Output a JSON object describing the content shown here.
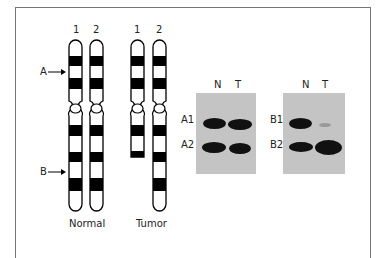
{
  "figure": {
    "chromosome_groups": [
      {
        "caption": "Normal",
        "chromosomes": [
          {
            "label": "1"
          },
          {
            "label": "2"
          }
        ]
      },
      {
        "caption": "Tumor",
        "chromosomes": [
          {
            "label": "1"
          },
          {
            "label": "2"
          }
        ]
      }
    ],
    "markers": [
      {
        "label": "A",
        "description": "locus A arrow"
      },
      {
        "label": "B",
        "description": "locus B arrow"
      }
    ],
    "blots": [
      {
        "lanes": [
          "N",
          "T"
        ],
        "rows": [
          {
            "label": "A1",
            "intensity": {
              "N": "strong",
              "T": "strong"
            }
          },
          {
            "label": "A2",
            "intensity": {
              "N": "strong",
              "T": "strong"
            }
          }
        ]
      },
      {
        "lanes": [
          "N",
          "T"
        ],
        "rows": [
          {
            "label": "B1",
            "intensity": {
              "N": "strong",
              "T": "faint"
            }
          },
          {
            "label": "B2",
            "intensity": {
              "N": "strong",
              "T": "very strong"
            }
          }
        ]
      }
    ],
    "colors": {
      "band": "#111111",
      "gel_background": "#c4c4c4",
      "frame": "#777777"
    }
  }
}
